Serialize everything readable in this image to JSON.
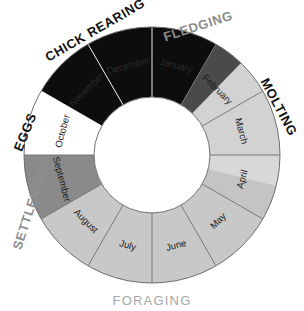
{
  "diagram": {
    "center_x": 152,
    "center_y": 155,
    "inner_radius": 58,
    "outer_radius": 128,
    "background_color": "#ffffff",
    "segment_border_color": "#6e6e6e"
  },
  "chart_data": {
    "type": "pie",
    "title": "",
    "subtitle": "",
    "xlabel": "",
    "ylabel": "",
    "legend_position": "around-ring",
    "grid": false,
    "start_angle_deg": 0,
    "direction": "clockwise",
    "categories": [
      "January",
      "February",
      "March",
      "April",
      "May",
      "June",
      "July",
      "August",
      "September",
      "October",
      "November",
      "December"
    ],
    "values": [
      30,
      30,
      30,
      30,
      30,
      30,
      30,
      30,
      30,
      30,
      30,
      30
    ],
    "segment_colors": [
      "#0d0d0d",
      "#d2d2d2",
      "#d2d2d2",
      "#d8d8d8",
      "#c8c8c8",
      "#c8c8c8",
      "#c8c8c8",
      "#c8c8c8",
      "#8a8a8a",
      "#ffffff",
      "#0d0d0d",
      "#0d0d0d"
    ],
    "annotations": [
      "CHICK REARING spans November through January",
      "FLEDGING follows January",
      "MOLTING spans February through early April",
      "FORAGING spans April through August",
      "SETTLEMENT covers September",
      "EGGS covers October"
    ]
  },
  "months": [
    {
      "label": "January",
      "start_deg": 0,
      "end_deg": 30,
      "color": "#0d0d0d",
      "label_color": "on-dark"
    },
    {
      "label": "February",
      "start_deg": 30,
      "end_deg": 60,
      "color": "#d2d2d2",
      "label_color": "normal"
    },
    {
      "label": "March",
      "start_deg": 60,
      "end_deg": 90,
      "color": "#d2d2d2",
      "label_color": "normal"
    },
    {
      "label": "April",
      "start_deg": 90,
      "end_deg": 120,
      "color": "#d8d8d8",
      "label_color": "normal"
    },
    {
      "label": "May",
      "start_deg": 120,
      "end_deg": 150,
      "color": "#c8c8c8",
      "label_color": "normal"
    },
    {
      "label": "June",
      "start_deg": 150,
      "end_deg": 180,
      "color": "#c8c8c8",
      "label_color": "normal"
    },
    {
      "label": "July",
      "start_deg": 180,
      "end_deg": 210,
      "color": "#c8c8c8",
      "label_color": "normal"
    },
    {
      "label": "August",
      "start_deg": 210,
      "end_deg": 240,
      "color": "#c8c8c8",
      "label_color": "normal"
    },
    {
      "label": "September",
      "start_deg": 240,
      "end_deg": 270,
      "color": "#8a8a8a",
      "label_color": "normal"
    },
    {
      "label": "October",
      "start_deg": 270,
      "end_deg": 300,
      "color": "#ffffff",
      "label_color": "normal"
    },
    {
      "label": "November",
      "start_deg": 300,
      "end_deg": 330,
      "color": "#0d0d0d",
      "label_color": "on-dark"
    },
    {
      "label": "December",
      "start_deg": 330,
      "end_deg": 360,
      "color": "#0d0d0d",
      "label_color": "on-dark"
    }
  ],
  "overlays": [
    {
      "name": "fledging-wedge",
      "start_deg": 30,
      "end_deg": 44,
      "color": "#4a4a4a"
    },
    {
      "name": "april-foraging-band",
      "start_deg": 104,
      "end_deg": 120,
      "color": "#c4c4c4"
    }
  ],
  "phases": [
    {
      "key": "chick_rearing",
      "label": "CHICK REARING",
      "color": "#101010",
      "position": "upper-left-arc"
    },
    {
      "key": "fledging",
      "label": "FLEDGING",
      "color": "#8c8c8c",
      "position": "upper-right-arc"
    },
    {
      "key": "molting",
      "label": "MOLTING",
      "color": "#101010",
      "position": "right-arc"
    },
    {
      "key": "foraging",
      "label": "FORAGING",
      "color": "#a8a8a8",
      "position": "bottom"
    },
    {
      "key": "settlement",
      "label": "SETTLEMENT",
      "color": "#8f8f8f",
      "position": "lower-left-arc"
    },
    {
      "key": "eggs",
      "label": "EGGS",
      "color": "#101010",
      "position": "left-arc"
    }
  ]
}
